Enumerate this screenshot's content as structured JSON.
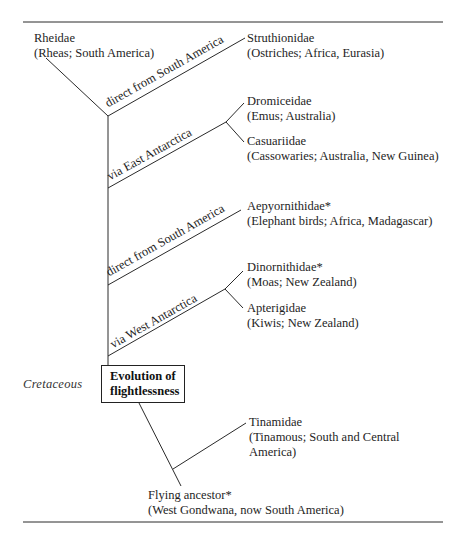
{
  "diagram": {
    "type": "phylogenetic-tree",
    "root": {
      "name": "Flying ancestor*",
      "desc": "(West Gondwana, now South America)"
    },
    "key_event": {
      "line1": "Evolution of",
      "line2": "flightlessness"
    },
    "era_label": "Cretaceous",
    "branch_labels": {
      "south_america_1": "direct from South America",
      "east_antarctica": "via East Antarctica",
      "south_america_2": "direct from South America",
      "west_antarctica": "via West Antarctica"
    },
    "taxa": [
      {
        "id": "rheidae",
        "name": "Rheidae",
        "desc": "(Rheas; South America)"
      },
      {
        "id": "struthionidae",
        "name": "Struthionidae",
        "desc": "(Ostriches; Africa, Eurasia)"
      },
      {
        "id": "dromiceidae",
        "name": "Dromiceidae",
        "desc": "(Emus; Australia)"
      },
      {
        "id": "casuariidae",
        "name": "Casuariidae",
        "desc": "(Cassowaries; Australia, New Guinea)"
      },
      {
        "id": "aepyornithidae",
        "name": "Aepyornithidae*",
        "desc": "(Elephant birds; Africa, Madagascar)"
      },
      {
        "id": "dinornithidae",
        "name": "Dinornithidae*",
        "desc": "(Moas; New Zealand)"
      },
      {
        "id": "apterigidae",
        "name": "Apterigidae",
        "desc": "(Kiwis; New Zealand)"
      },
      {
        "id": "tinamidae",
        "name": "Tinamidae",
        "desc_line1": "(Tinamous; South and Central",
        "desc_line2": "America)"
      }
    ]
  }
}
